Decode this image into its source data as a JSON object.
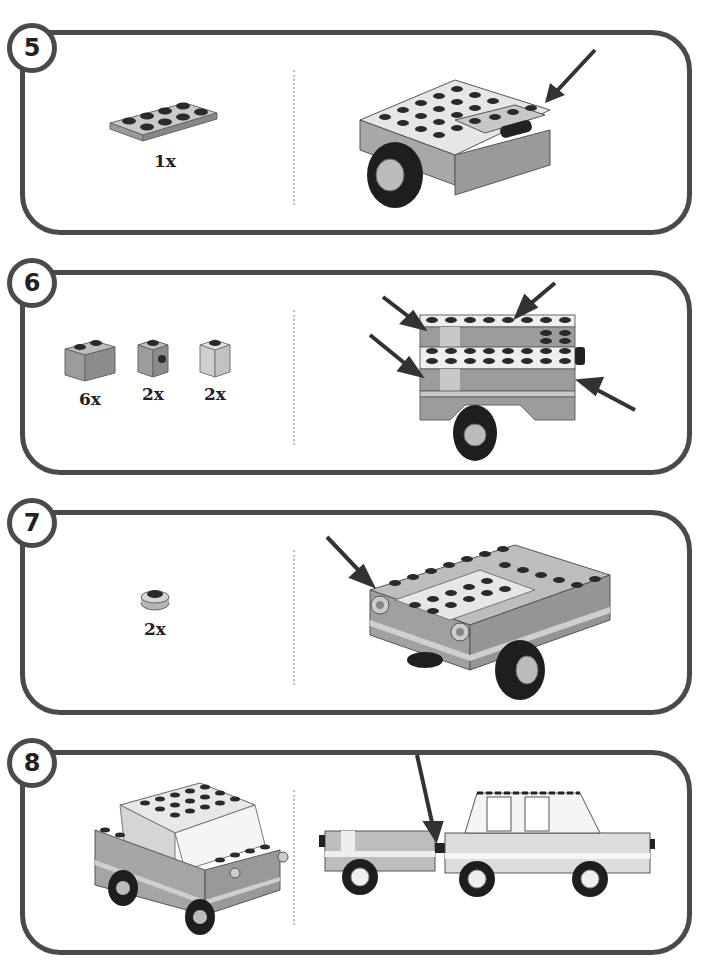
{
  "page": {
    "type": "building-instructions",
    "colors": {
      "border": "#4a4a4a",
      "brick_medium": "#9a9a9a",
      "brick_light": "#c8c8c8",
      "brick_white": "#eeeeee",
      "tire": "#1e1e1e",
      "arrow": "#333333"
    }
  },
  "steps": [
    {
      "number": "5",
      "parts": [
        {
          "name": "plate-2x4",
          "qty": "1x"
        }
      ],
      "assembly": {
        "description": "trailer chassis with plate added on rear",
        "arrows": 1
      }
    },
    {
      "number": "6",
      "parts": [
        {
          "name": "brick-1x2",
          "qty": "6x"
        },
        {
          "name": "brick-1x1-with-stud-on-side",
          "qty": "2x"
        },
        {
          "name": "brick-1x1-light",
          "qty": "2x"
        }
      ],
      "assembly": {
        "description": "top view of trailer with side bricks added",
        "arrows": 4
      }
    },
    {
      "number": "7",
      "parts": [
        {
          "name": "round-plate-1x1",
          "qty": "2x"
        }
      ],
      "assembly": {
        "description": "trailer with round lights on front",
        "arrows": 1
      }
    },
    {
      "number": "8",
      "parts": [],
      "car_preview": {
        "description": "completed car"
      },
      "assembly": {
        "description": "car towing the trailer, side view",
        "arrows": 1
      }
    }
  ]
}
